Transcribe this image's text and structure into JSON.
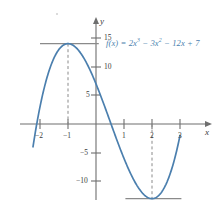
{
  "figure": {
    "function_label_lead": "f(x) = 2x",
    "function_label_exp1": "3",
    "function_label_mid": " − 3x",
    "function_label_exp2": "2",
    "function_label_tail": " − 12x + 7",
    "curve_color": "#4b7fae",
    "axis_color": "#6e6e6e",
    "label_color": "#3b3b3b"
  },
  "axes": {
    "x_axis_name": "x",
    "y_axis_name": "y",
    "x_ticks": [
      {
        "label": "−2",
        "value": -2
      },
      {
        "label": "−1",
        "value": -1
      },
      {
        "label": "1",
        "value": 1
      },
      {
        "label": "2",
        "value": 2
      },
      {
        "label": "3",
        "value": 3
      }
    ],
    "y_ticks": [
      {
        "label": "15",
        "value": 15
      },
      {
        "label": "10",
        "value": 10
      },
      {
        "label": "5",
        "value": 5
      },
      {
        "label": "−5",
        "value": -5
      },
      {
        "label": "−10",
        "value": -10
      }
    ]
  },
  "chart_data": {
    "type": "line",
    "xlabel": "x",
    "ylabel": "y",
    "xlim": [
      -2.25,
      3.0
    ],
    "ylim": [
      -15,
      16
    ],
    "grid": false,
    "legend": "none",
    "expression": "2*x**3 - 3*x**2 - 12*x + 7",
    "x": [
      -2.25,
      -2.0,
      -1.75,
      -1.5,
      -1.25,
      -1.0,
      -0.75,
      -0.5,
      -0.25,
      0.0,
      0.25,
      0.5,
      0.75,
      1.0,
      1.25,
      1.5,
      1.75,
      2.0,
      2.25,
      2.5,
      2.75,
      3.0
    ],
    "y": [
      -4.7,
      3.0,
      8.3,
      11.5,
      13.1,
      14.0,
      13.3,
      12.0,
      9.8,
      7.0,
      3.8,
      0.0,
      -3.9,
      -8.0,
      -11.8,
      -14.5,
      -15.9,
      -13.0,
      -11.4,
      -10.0,
      -6.1,
      0.0
    ],
    "annotations": [
      {
        "kind": "local-maximum",
        "x": -1,
        "y": 14,
        "marker": "horizontal tangent line and dashed vertical line"
      },
      {
        "kind": "local-minimum",
        "x": 2,
        "y": -13,
        "marker": "horizontal tangent line and dashed vertical line"
      }
    ],
    "tangent_lines": [
      {
        "at_x": -1,
        "y": 14,
        "x_start": -2.0,
        "x_end": 0.1
      },
      {
        "at_x": 2,
        "y": -13,
        "x_start": 1.05,
        "x_end": 3.05
      }
    ]
  }
}
